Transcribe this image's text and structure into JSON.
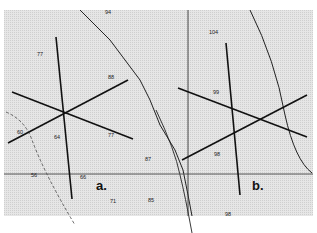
{
  "map": {
    "background_color": "#e4e4e4",
    "line_color": "#1a1a1a",
    "panels": [
      {
        "id": "a",
        "label": "a."
      },
      {
        "id": "b",
        "label": "b."
      }
    ],
    "depth_labels": [
      {
        "text": "94",
        "x": 105,
        "y": 14
      },
      {
        "text": "77",
        "x": 37,
        "y": 56
      },
      {
        "text": "88",
        "x": 108,
        "y": 79
      },
      {
        "text": "60",
        "x": 17,
        "y": 134
      },
      {
        "text": "64",
        "x": 54,
        "y": 139
      },
      {
        "text": "77",
        "x": 108,
        "y": 137
      },
      {
        "text": "87",
        "x": 145,
        "y": 161
      },
      {
        "text": "56",
        "x": 31,
        "y": 177
      },
      {
        "text": "66",
        "x": 80,
        "y": 179
      },
      {
        "text": "71",
        "x": 110,
        "y": 203
      },
      {
        "text": "85",
        "x": 148,
        "y": 202
      },
      {
        "text": "104",
        "x": 209,
        "y": 34
      },
      {
        "text": "99",
        "x": 213,
        "y": 94
      },
      {
        "text": "98",
        "x": 214,
        "y": 156
      },
      {
        "text": "98",
        "x": 225,
        "y": 216
      }
    ]
  }
}
